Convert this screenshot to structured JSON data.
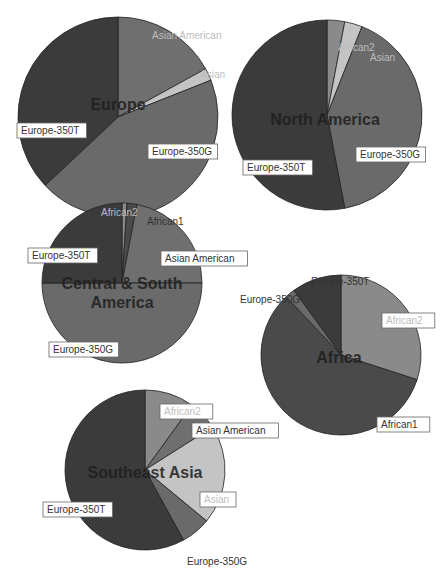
{
  "colors": {
    "Asian American": "#6f6f6f",
    "Asian": "#c4c4c4",
    "Europe-350G": "#6a6a6a",
    "Europe-350T": "#3b3b3b",
    "African1": "#4a4a4a",
    "African2": "#8a8a8a"
  },
  "chart_data": [
    {
      "type": "pie",
      "title": "Europe",
      "slices": [
        {
          "label": "Asian American",
          "value": 17
        },
        {
          "label": "Asian",
          "value": 2
        },
        {
          "label": "Europe-350G",
          "value": 44
        },
        {
          "label": "Europe-350T",
          "value": 37
        }
      ]
    },
    {
      "type": "pie",
      "title": "North America",
      "slices": [
        {
          "label": "African2",
          "value": 3
        },
        {
          "label": "Asian",
          "value": 3
        },
        {
          "label": "Europe-350G",
          "value": 41
        },
        {
          "label": "Europe-350T",
          "value": 53
        }
      ]
    },
    {
      "type": "pie",
      "title": "Central & South America",
      "slices": [
        {
          "label": "African2",
          "value": 1
        },
        {
          "label": "African1",
          "value": 2
        },
        {
          "label": "Asian American",
          "value": 22
        },
        {
          "label": "Europe-350G",
          "value": 50
        },
        {
          "label": "Europe-350T",
          "value": 25
        }
      ]
    },
    {
      "type": "pie",
      "title": "Africa",
      "slices": [
        {
          "label": "African2",
          "value": 30
        },
        {
          "label": "African1",
          "value": 58
        },
        {
          "label": "Europe-350G",
          "value": 2
        },
        {
          "label": "Europe-350T",
          "value": 10
        }
      ]
    },
    {
      "type": "pie",
      "title": "Southeast Asia",
      "slices": [
        {
          "label": "African2",
          "value": 10
        },
        {
          "label": "Asian American",
          "value": 6
        },
        {
          "label": "Asian",
          "value": 20
        },
        {
          "label": "Europe-350G",
          "value": 6
        },
        {
          "label": "Europe-350T",
          "value": 58
        }
      ]
    }
  ],
  "layout": [
    {
      "cx": 118,
      "cy": 117,
      "r": 100,
      "title_x": 118,
      "title_y": 110,
      "title_lines": [
        "Europe"
      ],
      "labels": [
        {
          "text": "Asian American",
          "x": 148,
          "y": 28,
          "boxed": false,
          "light": true
        },
        {
          "text": "Asian",
          "x": 196,
          "y": 67,
          "boxed": false,
          "light": true
        },
        {
          "text": "Europe-350G",
          "x": 148,
          "y": 144,
          "boxed": true,
          "light": false
        },
        {
          "text": "Europe-350T",
          "x": 17,
          "y": 123,
          "boxed": true,
          "light": false
        }
      ]
    },
    {
      "cx": 327,
      "cy": 115,
      "r": 95,
      "title_x": 325,
      "title_y": 125,
      "title_lines": [
        "North America"
      ],
      "labels": [
        {
          "text": "African2",
          "x": 334,
          "y": 40,
          "boxed": false,
          "light": true
        },
        {
          "text": "Asian",
          "x": 366,
          "y": 50,
          "boxed": false,
          "light": true
        },
        {
          "text": "Europe-350G",
          "x": 356,
          "y": 147,
          "boxed": true,
          "light": false
        },
        {
          "text": "Europe-350T",
          "x": 243,
          "y": 160,
          "boxed": true,
          "light": false
        }
      ]
    },
    {
      "cx": 122,
      "cy": 283,
      "r": 80,
      "title_x": 122,
      "title_y": 289,
      "title_lines": [
        "Central & South",
        "America"
      ],
      "labels": [
        {
          "text": "African2",
          "x": 97,
          "y": 205,
          "boxed": false,
          "light": true
        },
        {
          "text": "African1",
          "x": 143,
          "y": 214,
          "boxed": false,
          "light": false
        },
        {
          "text": "Asian American",
          "x": 161,
          "y": 251,
          "boxed": true,
          "light": false
        },
        {
          "text": "Europe-350T",
          "x": 28,
          "y": 248,
          "boxed": true,
          "light": false
        },
        {
          "text": "Europe-350G",
          "x": 49,
          "y": 342,
          "boxed": true,
          "light": false
        }
      ]
    },
    {
      "cx": 341,
      "cy": 355,
      "r": 80,
      "title_x": 339,
      "title_y": 363,
      "title_lines": [
        "Africa"
      ],
      "labels": [
        {
          "text": "Europe-350T",
          "x": 307,
          "y": 274,
          "boxed": false,
          "light": false
        },
        {
          "text": "Europe-350G",
          "x": 236,
          "y": 292,
          "boxed": false,
          "light": false
        },
        {
          "text": "African2",
          "x": 382,
          "y": 313,
          "boxed": true,
          "light": true
        },
        {
          "text": "African1",
          "x": 377,
          "y": 417,
          "boxed": true,
          "light": false
        }
      ]
    },
    {
      "cx": 145,
      "cy": 470,
      "r": 80,
      "title_x": 145,
      "title_y": 478,
      "title_lines": [
        "Southeast Asia"
      ],
      "labels": [
        {
          "text": "African2",
          "x": 160,
          "y": 404,
          "boxed": true,
          "light": true
        },
        {
          "text": "Asian American",
          "x": 192,
          "y": 423,
          "boxed": true,
          "light": false
        },
        {
          "text": "Asian",
          "x": 200,
          "y": 492,
          "boxed": true,
          "light": true
        },
        {
          "text": "Europe-350T",
          "x": 43,
          "y": 502,
          "boxed": true,
          "light": false
        },
        {
          "text": "Europe-350G",
          "x": 183,
          "y": 554,
          "boxed": false,
          "light": false
        }
      ]
    }
  ]
}
